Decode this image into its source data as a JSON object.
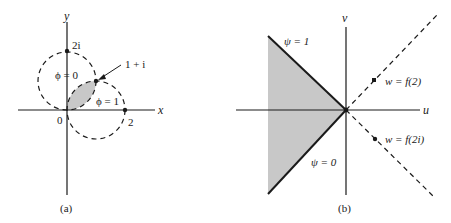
{
  "panel_a": {
    "caption": "(a)",
    "x_axis_label": "x",
    "y_axis_label": "y",
    "origin_label": "0",
    "point_2_label": "2",
    "point_2i_label": "2i",
    "point_1pi_label": "1 + i",
    "phi0_label": "ϕ = 0",
    "phi1_label": "ϕ = 1"
  },
  "panel_b": {
    "caption": "(b)",
    "u_axis_label": "u",
    "v_axis_label": "v",
    "psi1_label": "ψ = 1",
    "psi0_label": "ψ = 0",
    "f2_label": "w = f(2)",
    "f2i_label": "w = f(2i)"
  },
  "colors": {
    "line": "#1a1a1a",
    "shade": "#c8c8c8"
  }
}
